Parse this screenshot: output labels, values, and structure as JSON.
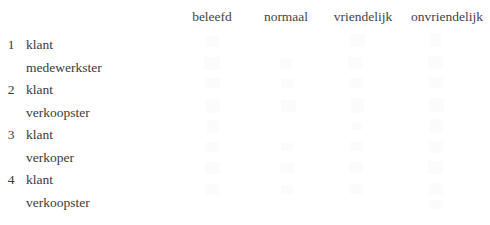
{
  "document": {
    "language": "nl",
    "background_color": "#ffffff",
    "text_color": "#3a3a3a",
    "header_text_color": "#444444",
    "ghost_mark_color": "#fbfbfc"
  },
  "table": {
    "corner_label": "",
    "columns": [
      {
        "label": "beleefd"
      },
      {
        "label": "normaal"
      },
      {
        "label": "vriendelijk"
      },
      {
        "label": "onvriendelijk"
      }
    ],
    "rows": [
      {
        "number": "1",
        "lines": [
          {
            "label": "klant"
          },
          {
            "label": "medewerkster"
          }
        ]
      },
      {
        "number": "2",
        "lines": [
          {
            "label": "klant"
          },
          {
            "label": "verkoopster"
          }
        ]
      },
      {
        "number": "3",
        "lines": [
          {
            "label": "klant"
          },
          {
            "label": "verkoper"
          }
        ]
      },
      {
        "number": "4",
        "lines": [
          {
            "label": "klant"
          },
          {
            "label": "verkoopster"
          }
        ]
      }
    ]
  },
  "ghost_marks": [
    {
      "x": 206,
      "y": 36,
      "w": 13,
      "h": 11
    },
    {
      "x": 350,
      "y": 34,
      "w": 15,
      "h": 13
    },
    {
      "x": 430,
      "y": 33,
      "w": 11,
      "h": 14
    },
    {
      "x": 204,
      "y": 57,
      "w": 16,
      "h": 13
    },
    {
      "x": 280,
      "y": 58,
      "w": 12,
      "h": 11
    },
    {
      "x": 348,
      "y": 57,
      "w": 14,
      "h": 12
    },
    {
      "x": 428,
      "y": 56,
      "w": 15,
      "h": 13
    },
    {
      "x": 205,
      "y": 78,
      "w": 15,
      "h": 10
    },
    {
      "x": 281,
      "y": 79,
      "w": 13,
      "h": 9
    },
    {
      "x": 350,
      "y": 78,
      "w": 13,
      "h": 10
    },
    {
      "x": 429,
      "y": 77,
      "w": 14,
      "h": 11
    },
    {
      "x": 206,
      "y": 99,
      "w": 14,
      "h": 14
    },
    {
      "x": 281,
      "y": 100,
      "w": 15,
      "h": 12
    },
    {
      "x": 351,
      "y": 98,
      "w": 13,
      "h": 15
    },
    {
      "x": 429,
      "y": 98,
      "w": 15,
      "h": 14
    },
    {
      "x": 207,
      "y": 120,
      "w": 12,
      "h": 13
    },
    {
      "x": 352,
      "y": 122,
      "w": 10,
      "h": 8
    },
    {
      "x": 430,
      "y": 119,
      "w": 13,
      "h": 14
    },
    {
      "x": 206,
      "y": 142,
      "w": 13,
      "h": 10
    },
    {
      "x": 281,
      "y": 143,
      "w": 12,
      "h": 8
    },
    {
      "x": 350,
      "y": 142,
      "w": 13,
      "h": 9
    },
    {
      "x": 429,
      "y": 141,
      "w": 14,
      "h": 12
    },
    {
      "x": 205,
      "y": 162,
      "w": 15,
      "h": 12
    },
    {
      "x": 280,
      "y": 163,
      "w": 14,
      "h": 10
    },
    {
      "x": 349,
      "y": 162,
      "w": 14,
      "h": 11
    },
    {
      "x": 428,
      "y": 161,
      "w": 15,
      "h": 13
    },
    {
      "x": 206,
      "y": 184,
      "w": 13,
      "h": 11
    },
    {
      "x": 281,
      "y": 185,
      "w": 12,
      "h": 9
    },
    {
      "x": 350,
      "y": 184,
      "w": 13,
      "h": 10
    },
    {
      "x": 429,
      "y": 183,
      "w": 14,
      "h": 12
    },
    {
      "x": 430,
      "y": 200,
      "w": 12,
      "h": 9
    }
  ]
}
